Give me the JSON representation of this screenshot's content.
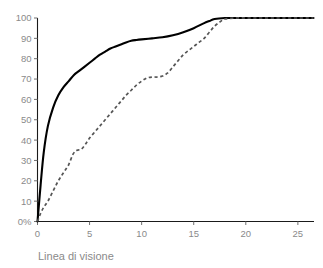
{
  "chart_data": {
    "type": "line",
    "title": "",
    "subtitle": "",
    "xlabel": "Linea di visione",
    "ylabel": "",
    "xlim": [
      0,
      26.5
    ],
    "ylim": [
      0,
      100
    ],
    "grid": false,
    "legend": "none",
    "x_ticks": [
      "0",
      "5",
      "10",
      "15",
      "20",
      "25"
    ],
    "x_tick_values": [
      0,
      5,
      10,
      15,
      20,
      25
    ],
    "y_ticks": [
      "0%",
      "10",
      "20",
      "30",
      "40",
      "50",
      "60",
      "70",
      "80",
      "90",
      "100"
    ],
    "y_tick_values": [
      0,
      10,
      20,
      30,
      40,
      50,
      60,
      70,
      80,
      90,
      100
    ],
    "series": [
      {
        "name": "solid-series",
        "style": "solid",
        "color": "#000000",
        "x": [
          0,
          0.3,
          0.6,
          1.0,
          1.5,
          2.0,
          2.5,
          3.0,
          3.5,
          4.0,
          4.5,
          5.0,
          5.5,
          6.0,
          6.5,
          7.0,
          7.5,
          8.0,
          8.5,
          9.0,
          9.5,
          10.0,
          11.0,
          12.0,
          13.0,
          14.0,
          15.0,
          16.0,
          16.5,
          17.0,
          18.0,
          19.0,
          20.0,
          21.0,
          22.0,
          23.0,
          24.0,
          25.0,
          26.0,
          26.5
        ],
        "y": [
          0,
          18,
          34,
          47,
          56,
          62,
          66,
          69,
          72,
          74,
          76,
          78,
          80,
          82,
          83.5,
          85,
          86,
          87,
          88,
          88.8,
          89.2,
          89.5,
          90,
          90.5,
          91.5,
          93,
          95,
          97.5,
          98.5,
          99.5,
          100,
          100,
          100,
          100,
          100,
          100,
          100,
          100,
          100,
          100
        ]
      },
      {
        "name": "dashed-series",
        "style": "dashed",
        "color": "#555555",
        "x": [
          0,
          0.3,
          0.6,
          1.0,
          1.5,
          2.0,
          2.5,
          3.0,
          3.4,
          3.8,
          4.2,
          4.6,
          5.0,
          5.5,
          6.0,
          6.5,
          7.0,
          7.5,
          8.0,
          8.5,
          9.0,
          9.5,
          10.0,
          10.5,
          11.0,
          11.5,
          12.0,
          12.5,
          13.0,
          13.5,
          14.0,
          14.5,
          15.0,
          15.5,
          16.0,
          16.5,
          17.0,
          17.5,
          18.0,
          19.0,
          20.0,
          21.0,
          22.0,
          23.0,
          24.0,
          25.0,
          26.0,
          26.5
        ],
        "y": [
          0,
          4,
          7,
          10,
          15,
          20,
          24,
          28,
          33,
          35,
          35.5,
          38,
          41,
          44,
          47,
          50,
          53,
          56,
          59,
          62,
          64.5,
          67,
          69,
          70.5,
          71,
          71,
          71.5,
          73,
          76,
          79,
          82,
          84,
          86,
          88,
          90,
          93,
          96,
          98,
          99.5,
          100,
          100,
          100,
          100,
          100,
          100,
          100,
          100,
          100
        ]
      }
    ]
  },
  "axis": {
    "x_title": "Linea di visione"
  }
}
